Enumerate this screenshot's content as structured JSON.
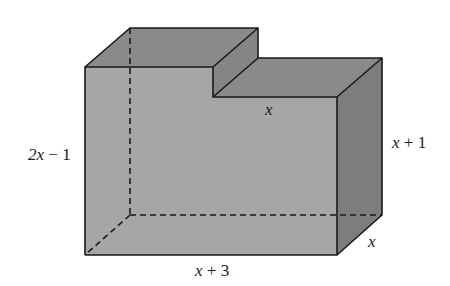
{
  "figure": {
    "type": "stepped-rectangular-solid",
    "colors": {
      "front_face": "#a6a6a6",
      "top_face": "#8a8a8a",
      "side_face": "#7d7d7d",
      "step_riser": "#858585",
      "edge": "#1a1a1a",
      "background": "#ffffff"
    },
    "labels": {
      "height_left": {
        "var": "2x",
        "op": " − ",
        "const": "1"
      },
      "height_right": {
        "var": "x",
        "op": " + ",
        "const": "1"
      },
      "step_width": {
        "var": "x"
      },
      "length_bottom": {
        "var": "x",
        "op": " + ",
        "const": "3"
      },
      "depth": {
        "var": "x"
      }
    }
  }
}
